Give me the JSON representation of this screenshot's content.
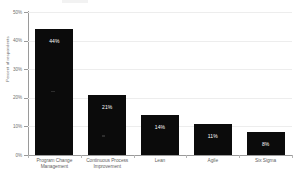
{
  "chart_data": {
    "type": "bar",
    "title": "",
    "xlabel": "",
    "ylabel": "Percent of respondents",
    "ylim": [
      0,
      50
    ],
    "ytick_labels": [
      "0%",
      "10%",
      "20%",
      "30%",
      "40%",
      "50%"
    ],
    "ytick_values": [
      0,
      10,
      20,
      30,
      40,
      50
    ],
    "grid": true,
    "legend": "none",
    "categories": [
      "Program Change Management",
      "Continuous Process Improvement",
      "Lean",
      "Agile",
      "Six Sigma"
    ],
    "category_lines": [
      [
        "Program Change",
        "Management"
      ],
      [
        "Continuous Process",
        "Improvement"
      ],
      [
        "Lean"
      ],
      [
        "Agile"
      ],
      [
        "Six Sigma"
      ]
    ],
    "values": [
      44,
      21,
      14,
      11,
      8
    ],
    "data_labels": [
      "44%",
      "21%",
      "14%",
      "11%",
      "8%"
    ],
    "bar_color": "#0b0b0b",
    "data_label_color": "#ffffff",
    "gridline_color": "#ededed",
    "axis_color": "#9a9a9a",
    "background_color": "#ffffff"
  }
}
